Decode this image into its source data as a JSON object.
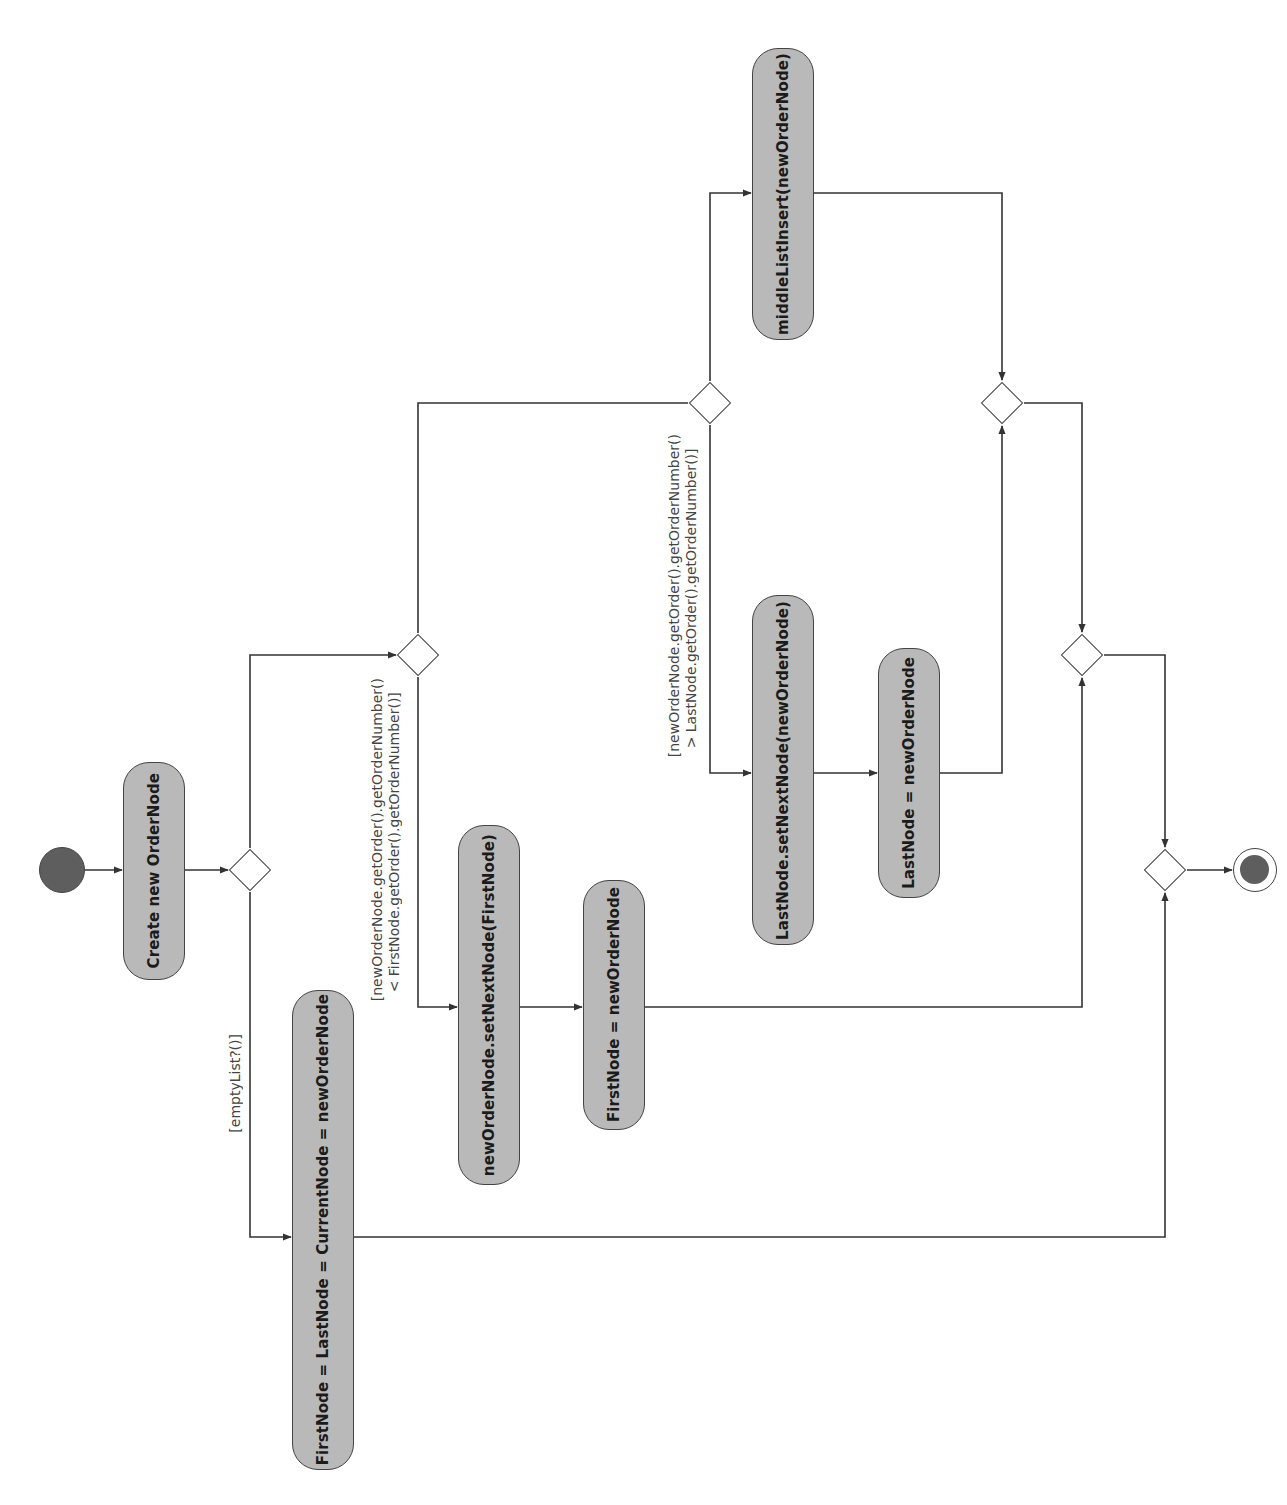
{
  "diagram": {
    "type": "UML activity diagram",
    "orientation": "rotated 90° (flow runs left to right, text reads bottom-to-top)",
    "colors": {
      "action_fill": "#b9b9b9",
      "stroke": "#444444",
      "initial_fill": "#5e5e5e",
      "background": "#ffffff"
    },
    "nodes": {
      "initial": {
        "kind": "initial-node"
      },
      "create_node": {
        "kind": "action",
        "label": "Create new OrderNode"
      },
      "decision_empty": {
        "kind": "decision"
      },
      "empty_list_action": {
        "kind": "action",
        "label": "FirstNode = LastNode = CurrentNode = newOrderNode"
      },
      "decision_first": {
        "kind": "decision"
      },
      "set_next_first": {
        "kind": "action",
        "label": "newOrderNode.setNextNode(FirstNode)"
      },
      "assign_first": {
        "kind": "action",
        "label": "FirstNode = newOrderNode"
      },
      "decision_last": {
        "kind": "decision"
      },
      "middle_insert": {
        "kind": "action",
        "label": "middleListInsert(newOrderNode)"
      },
      "set_next_last": {
        "kind": "action",
        "label": "LastNode.setNextNode(newOrderNode)"
      },
      "assign_last": {
        "kind": "action",
        "label": "LastNode = newOrderNode"
      },
      "merge_last": {
        "kind": "merge"
      },
      "merge_first": {
        "kind": "merge"
      },
      "merge_final": {
        "kind": "merge"
      },
      "final": {
        "kind": "final-node"
      }
    },
    "guards": {
      "empty_list": "[emptyList?()]",
      "less_than_first": "[newOrderNode.getOrder().getOrderNumber()\n  < FirstNode.getOrder().getOrderNumber()]",
      "greater_than_last": "[newOrderNode.getOrder().getOrderNumber()\n  > LastNode.getOrder().getOrderNumber()]"
    },
    "edges": [
      {
        "from": "initial",
        "to": "create_node"
      },
      {
        "from": "create_node",
        "to": "decision_empty"
      },
      {
        "from": "decision_empty",
        "to": "empty_list_action",
        "guard": "[emptyList?()]"
      },
      {
        "from": "decision_empty",
        "to": "decision_first"
      },
      {
        "from": "decision_first",
        "to": "set_next_first",
        "guard": "< FirstNode"
      },
      {
        "from": "decision_first",
        "to": "decision_last"
      },
      {
        "from": "set_next_first",
        "to": "assign_first"
      },
      {
        "from": "decision_last",
        "to": "set_next_last",
        "guard": "> LastNode"
      },
      {
        "from": "decision_last",
        "to": "middle_insert"
      },
      {
        "from": "set_next_last",
        "to": "assign_last"
      },
      {
        "from": "assign_last",
        "to": "merge_last"
      },
      {
        "from": "middle_insert",
        "to": "merge_last"
      },
      {
        "from": "merge_last",
        "to": "merge_first"
      },
      {
        "from": "assign_first",
        "to": "merge_first"
      },
      {
        "from": "merge_first",
        "to": "merge_final"
      },
      {
        "from": "empty_list_action",
        "to": "merge_final"
      },
      {
        "from": "merge_final",
        "to": "final"
      }
    ]
  }
}
